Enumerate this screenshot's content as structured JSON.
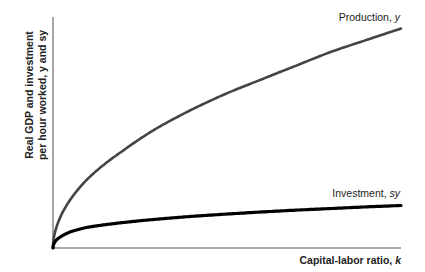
{
  "chart_data": {
    "type": "line",
    "title": "",
    "xlabel": "Capital-labor ratio, k",
    "ylabel_lines": [
      "Real GDP and investment",
      "per hour worked, y and sy"
    ],
    "xlim": [
      0,
      1
    ],
    "ylim": [
      0,
      1
    ],
    "grid": false,
    "ticks": false,
    "series": [
      {
        "name": "Production, y",
        "label": "Production, y",
        "color": "#444444",
        "function": "y = A * k^0.5",
        "x": [
          0,
          0.01,
          0.05,
          0.1,
          0.2,
          0.3,
          0.4,
          0.5,
          0.6,
          0.7,
          0.8,
          0.9,
          1.0
        ],
        "values": [
          0,
          0.09,
          0.21,
          0.3,
          0.42,
          0.52,
          0.6,
          0.67,
          0.73,
          0.79,
          0.85,
          0.9,
          0.95
        ]
      },
      {
        "name": "Investment, sy",
        "label": "Investment, sy",
        "color": "#000000",
        "function": "sy = s * A * k^0.5",
        "x": [
          0,
          0.01,
          0.05,
          0.1,
          0.2,
          0.3,
          0.4,
          0.5,
          0.6,
          0.7,
          0.8,
          0.9,
          1.0
        ],
        "values": [
          0,
          0.035,
          0.07,
          0.09,
          0.11,
          0.125,
          0.137,
          0.147,
          0.156,
          0.164,
          0.171,
          0.178,
          0.184
        ]
      }
    ]
  }
}
